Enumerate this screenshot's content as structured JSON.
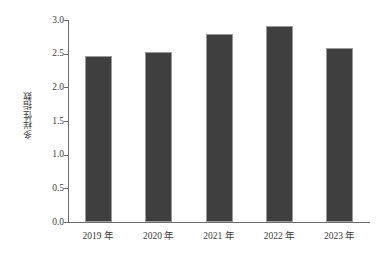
{
  "chart_data": {
    "type": "bar",
    "title": "",
    "xlabel": "",
    "ylabel": "多样性指数",
    "categories": [
      "2019 年",
      "2020 年",
      "2021 年",
      "2022 年",
      "2023 年"
    ],
    "values": [
      2.47,
      2.52,
      2.79,
      2.91,
      2.58
    ],
    "ylim": [
      0.0,
      3.0
    ],
    "yticks": [
      "0.0",
      "0.5",
      "1.0",
      "1.5",
      "2.0",
      "2.5",
      "3.0"
    ],
    "ytick_values": [
      0.0,
      0.5,
      1.0,
      1.5,
      2.0,
      2.5,
      3.0
    ],
    "grid": false,
    "legend": null,
    "bar_color": "#3f3f3f",
    "bar_edge_color": "#9a9a9a",
    "axis_color": "#6e6e6e",
    "text_color": "#3c3c3c",
    "background": "#ffffff"
  }
}
